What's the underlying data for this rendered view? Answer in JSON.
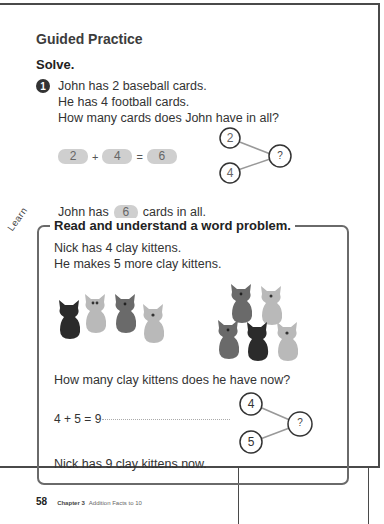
{
  "section": {
    "title": "Guided Practice",
    "instruction": "Solve."
  },
  "problem1": {
    "number": "1",
    "lines": [
      "John has 2 baseball cards.",
      "He has 4 football cards.",
      "How many cards does John have in all?"
    ],
    "equation": {
      "a": "2",
      "op": "+",
      "b": "4",
      "eq": "=",
      "result": "6"
    },
    "number_bond": {
      "part1": "2",
      "part2": "4",
      "whole": "?"
    },
    "answer": {
      "prefix": "John has",
      "value": "6",
      "suffix": "cards in all."
    }
  },
  "learn": {
    "tab_label": "Learn",
    "title": "Read and understand a word problem.",
    "lines": [
      "Nick has 4 clay kittens.",
      "He makes 5 more clay kittens."
    ],
    "group1_kittens": [
      "black",
      "light",
      "gray",
      "light"
    ],
    "group2_kittens": [
      "gray",
      "light",
      "gray",
      "black",
      "light"
    ],
    "question": "How many clay kittens does he have now?",
    "equation": "4 + 5 = 9",
    "number_bond": {
      "part1": "4",
      "part2": "5",
      "whole": "?"
    },
    "conclusion": "Nick has 9 clay kittens now."
  },
  "footer": {
    "page_number": "58",
    "chapter": "Chapter 3",
    "chapter_title": "Addition Facts to 10"
  },
  "colors": {
    "kitten_black": "#2b2b2b",
    "kitten_gray": "#6a6a6a",
    "kitten_light": "#b9b9b9",
    "answer_box": "#cfcfcf"
  }
}
